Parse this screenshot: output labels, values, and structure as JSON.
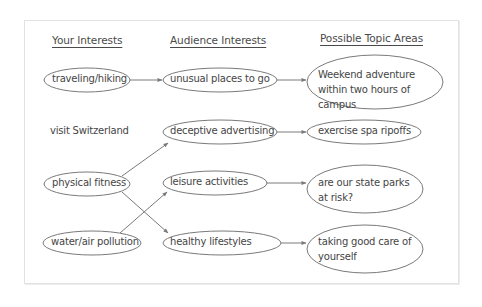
{
  "headers": {
    "your_interests": "Your Interests",
    "audience_interests": "Audience Interests",
    "topic_areas": "Possible Topic Areas"
  },
  "your_interests": [
    {
      "label": "traveling/hiking",
      "circled": true
    },
    {
      "label": "visit Switzerland",
      "circled": false
    },
    {
      "label": "physical fitness",
      "circled": true
    },
    {
      "label": "water/air pollution",
      "circled": true
    }
  ],
  "audience_interests": [
    {
      "label": "unusual places to go"
    },
    {
      "label": "deceptive advertising"
    },
    {
      "label": "leisure activities"
    },
    {
      "label": "healthy lifestyles"
    }
  ],
  "topic_areas": [
    {
      "label": "Weekend adventure within two hours of campus"
    },
    {
      "label": "exercise spa ripoffs"
    },
    {
      "label": "are our state parks at risk?"
    },
    {
      "label": "taking good care of yourself"
    }
  ],
  "connections": [
    {
      "from": "traveling/hiking",
      "to": "unusual places to go"
    },
    {
      "from": "physical fitness",
      "to": "deceptive advertising"
    },
    {
      "from": "physical fitness",
      "to": "healthy lifestyles"
    },
    {
      "from": "water/air pollution",
      "to": "leisure activities"
    },
    {
      "from": "unusual places to go",
      "to": "Weekend adventure within two hours of campus"
    },
    {
      "from": "deceptive advertising",
      "to": "exercise spa ripoffs"
    },
    {
      "from": "leisure activities",
      "to": "are our state parks at risk?"
    },
    {
      "from": "healthy lifestyles",
      "to": "taking good care of yourself"
    }
  ],
  "colors": {
    "stroke": "#7a7a7a",
    "text": "#454545",
    "frame": "#e2e2e2"
  }
}
